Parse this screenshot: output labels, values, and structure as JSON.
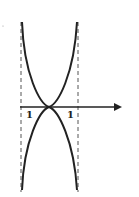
{
  "diagram": {
    "type": "function-graph",
    "x_axis": {
      "from": [
        20,
        107
      ],
      "to": [
        126,
        107
      ],
      "arrow": true
    },
    "asymptotes": [
      {
        "x": 21,
        "y1": 22,
        "y2": 192,
        "style": "dashed"
      },
      {
        "x": 78,
        "y1": 22,
        "y2": 192,
        "style": "dashed"
      }
    ],
    "labels": [
      {
        "text": "1",
        "x": 27,
        "y": 118
      },
      {
        "text": "1",
        "x": 68,
        "y": 118
      }
    ],
    "curves": [
      {
        "name": "upper-curve",
        "path": "M22,22 C24,75 40,104 49,107 C58,104 74,75 77,22"
      },
      {
        "name": "lower-curve",
        "path": "M22,190 C24,140 40,110 49,107 C58,110 74,140 77,190"
      }
    ],
    "colors": {
      "line": "#222222",
      "dashed": "#555555",
      "background": "#ffffff"
    }
  }
}
